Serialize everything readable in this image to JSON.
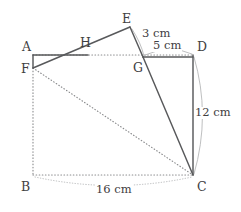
{
  "figure": {
    "type": "geometry-diagram",
    "canvas": {
      "width": 241,
      "height": 212
    },
    "colors": {
      "background": "#ffffff",
      "solid_edge": "#58595b",
      "dotted_edge": "#8a8b8d",
      "dimension_arc": "#b2b3b5",
      "label_text": "#3f4042"
    }
  },
  "vertices": [
    {
      "id": "A",
      "label": "A",
      "x": 33,
      "y": 55,
      "label_x": 22,
      "label_y": 41
    },
    {
      "id": "B",
      "label": "B",
      "x": 33,
      "y": 175,
      "label_x": 21,
      "label_y": 181
    },
    {
      "id": "C",
      "label": "C",
      "x": 193,
      "y": 175,
      "label_x": 197,
      "label_y": 181
    },
    {
      "id": "D",
      "label": "D",
      "x": 193,
      "y": 55,
      "label_x": 197,
      "label_y": 41
    },
    {
      "id": "E",
      "label": "E",
      "x": 130,
      "y": 27,
      "label_x": 122,
      "label_y": 13
    },
    {
      "id": "F",
      "label": "F",
      "x": 33,
      "y": 68,
      "label_x": 21,
      "label_y": 63
    },
    {
      "id": "G",
      "label": "G",
      "x": 143,
      "y": 57,
      "label_x": 133,
      "label_y": 62
    },
    {
      "id": "H",
      "label": "H",
      "x": 88,
      "y": 48,
      "label_x": 80,
      "label_y": 37
    }
  ],
  "edges": [
    {
      "id": "A-F",
      "from": "A",
      "to": "F",
      "style": "solid",
      "path": "M 33 55 L 33 68"
    },
    {
      "id": "A-H",
      "from": "A",
      "to": "H",
      "style": "solid",
      "path": "M 33 55 L 88 55"
    },
    {
      "id": "F-E",
      "from": "F",
      "to": "E",
      "style": "solid",
      "path": "M 33 68 L 130 27"
    },
    {
      "id": "E-G",
      "from": "E",
      "to": "G",
      "style": "solid",
      "path": "M 130 27 L 143 57"
    },
    {
      "id": "G-D",
      "from": "G",
      "to": "D",
      "style": "solid",
      "path": "M 143 57 L 193 57"
    },
    {
      "id": "D-C",
      "from": "D",
      "to": "C",
      "style": "solid",
      "path": "M 193 55 L 193 175"
    },
    {
      "id": "G-C",
      "from": "G",
      "to": "C",
      "style": "solid",
      "path": "M 143 57 L 193 175"
    },
    {
      "id": "A-D",
      "from": "A",
      "to": "D",
      "style": "dotted",
      "path": "M 33 55 L 193 55"
    },
    {
      "id": "F-B",
      "from": "F",
      "to": "B",
      "style": "dotted",
      "path": "M 33 68 L 33 175"
    },
    {
      "id": "B-C",
      "from": "B",
      "to": "C",
      "style": "dotted",
      "path": "M 33 175 L 193 175"
    },
    {
      "id": "F-C",
      "from": "F",
      "to": "C",
      "style": "dotted",
      "path": "M 33 68 L 193 175"
    }
  ],
  "dimensions": [
    {
      "id": "dim-EG",
      "label": "3 cm",
      "segment": "E-G",
      "value": 3,
      "unit": "cm",
      "label_x": 141,
      "label_y": 28,
      "arc_path": "M 132 29 Q 141 43 144 56",
      "arc_style": "solid"
    },
    {
      "id": "dim-GD",
      "label": "5 cm",
      "segment": "G-D",
      "value": 5,
      "unit": "cm",
      "label_x": 152,
      "label_y": 40,
      "arc_path": "M 145 55 Q 170 44 192 54",
      "arc_style": "solid"
    },
    {
      "id": "dim-DC",
      "label": "12 cm",
      "segment": "D-C",
      "value": 12,
      "unit": "cm",
      "label_x": 194,
      "label_y": 107,
      "arc_path": "M 194 57 Q 211 115 194 174",
      "arc_style": "solid"
    },
    {
      "id": "dim-BC",
      "label": "16 cm",
      "segment": "B-C",
      "value": 16,
      "unit": "cm",
      "label_x": 95,
      "label_y": 184,
      "arc_path": "M 35 177 Q 114 194 192 177",
      "arc_style": "dotted"
    }
  ]
}
